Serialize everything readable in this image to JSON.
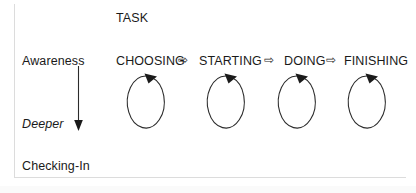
{
  "figure": {
    "title": "TASK",
    "axis": {
      "top_label": "Awareness",
      "middle_label": "Deeper",
      "bottom_label": "Checking-In",
      "direction_icon": "down-arrow-icon"
    },
    "flow_arrow_glyph": "⇨",
    "loop_icon": "circular-loop-arrow-icon",
    "stages": [
      {
        "label": "CHOOSING"
      },
      {
        "label": "STARTING"
      },
      {
        "label": "DOING"
      },
      {
        "label": "FINISHING"
      }
    ],
    "connectors": [
      {
        "glyph": "⇨"
      },
      {
        "glyph": "⇨"
      },
      {
        "glyph": "⇨"
      }
    ],
    "colors": {
      "text": "#1a1a1a",
      "stroke": "#2b2b2b",
      "frame": "#dcdcdc",
      "background": "#ffffff"
    }
  }
}
